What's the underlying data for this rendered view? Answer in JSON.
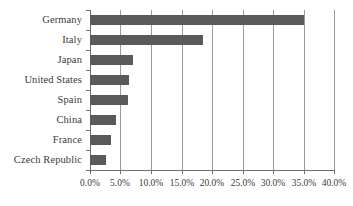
{
  "chart_data": {
    "type": "bar",
    "orientation": "horizontal",
    "title": "",
    "subtitle": "",
    "xlabel": "",
    "ylabel": "",
    "categories": [
      "Germany",
      "Italy",
      "Japan",
      "United States",
      "Spain",
      "China",
      "France",
      "Czech Republic"
    ],
    "values": [
      35.0,
      18.5,
      7.0,
      6.4,
      6.2,
      4.3,
      3.4,
      2.6
    ],
    "value_unit": "percent",
    "xlim": [
      0,
      40
    ],
    "xticks": [
      0,
      5,
      10,
      15,
      20,
      25,
      30,
      35,
      40
    ],
    "xtick_labels": [
      "0.0%",
      "5.0%",
      "10.0%",
      "15.0%",
      "20.0%",
      "25.0%",
      "30.0%",
      "35.0%",
      "40.0%"
    ],
    "grid": true,
    "grid_axis": "x",
    "legend": false,
    "legend_position": "none",
    "series": [
      {
        "name": "share",
        "values": [
          35.0,
          18.5,
          7.0,
          6.4,
          6.2,
          4.3,
          3.4,
          2.6
        ]
      }
    ],
    "colors": {
      "bar_fill": "#5a5a5a",
      "gridline": "#9a9a9a",
      "axis_line": "#6f6f6f",
      "text": "#3c3a38",
      "background": "#ffffff"
    }
  }
}
